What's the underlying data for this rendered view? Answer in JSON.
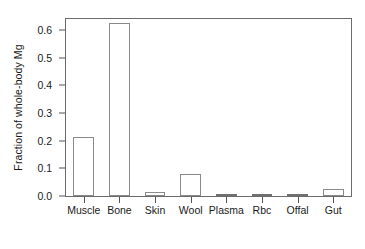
{
  "chart_data": {
    "type": "bar",
    "title": "",
    "subtitle": "",
    "xlabel": "",
    "ylabel": "Fraction of whole-body Mg",
    "categories": [
      "Muscle",
      "Bone",
      "Skin",
      "Wool",
      "Plasma",
      "Rbc",
      "Offal",
      "Gut"
    ],
    "values": [
      0.213,
      0.625,
      0.015,
      0.079,
      0.003,
      0.003,
      0.003,
      0.027
    ],
    "series": [
      {
        "name": "Fraction of whole-body Mg",
        "values": [
          0.213,
          0.625,
          0.015,
          0.079,
          0.003,
          0.003,
          0.003,
          0.027
        ]
      }
    ],
    "ylim": [
      0.0,
      0.64
    ],
    "xlim_note": "categorical",
    "ytick_labels": [
      "0.0",
      "0.1",
      "0.2",
      "0.3",
      "0.4",
      "0.5",
      "0.6"
    ],
    "ytick_values": [
      0.0,
      0.1,
      0.2,
      0.3,
      0.4,
      0.5,
      0.6
    ],
    "grid": false,
    "legend": false,
    "legend_position": "none",
    "bar_fill_color": "#ffffff",
    "bar_border_color": "#8a8a8a",
    "axis_color": "#6b6b6b",
    "text_color": "#1a1a1a",
    "background_color": "#ffffff",
    "annotations": []
  }
}
